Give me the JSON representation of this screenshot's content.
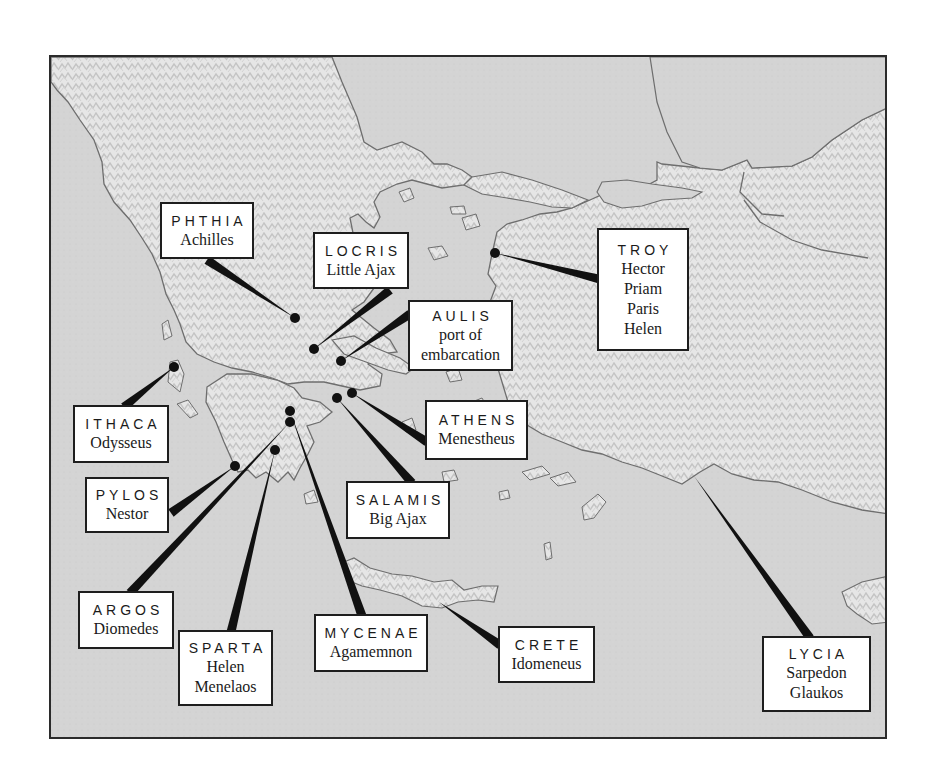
{
  "map": {
    "title": "Homeric Greece and Asia Minor",
    "colors": {
      "sea": "#d6d6d6",
      "land": "#e8e8e8",
      "relief": "#bdbdbd",
      "coast": "#6e6e6e",
      "marker": "#111111",
      "box_border": "#1e1e1e"
    }
  },
  "labels": [
    {
      "id": "phthia",
      "place": "PHTHIA",
      "people": [
        "Achilles"
      ],
      "box": [
        160,
        202,
        94,
        57
      ],
      "dot": [
        293,
        316
      ],
      "anchor": [
        205,
        258
      ]
    },
    {
      "id": "locris",
      "place": "LOCRIS",
      "people": [
        "Little Ajax"
      ],
      "box": [
        313,
        232,
        96,
        57
      ],
      "dot": [
        312,
        347
      ],
      "anchor": [
        388,
        288
      ]
    },
    {
      "id": "aulis",
      "place": "AULIS",
      "people": [
        "port of",
        "embarcation"
      ],
      "box": [
        408,
        300,
        105,
        71
      ],
      "dot": [
        339,
        359
      ],
      "anchor": [
        408,
        312
      ]
    },
    {
      "id": "troy",
      "place": "TROY",
      "people": [
        "Hector",
        "Priam",
        "Paris",
        "Helen"
      ],
      "box": [
        597,
        228,
        92,
        123
      ],
      "dot": [
        493,
        251
      ],
      "anchor": [
        597,
        277
      ]
    },
    {
      "id": "ithaca",
      "place": "ITHACA",
      "people": [
        "Odysseus"
      ],
      "box": [
        73,
        405,
        96,
        58
      ],
      "dot": [
        172,
        365
      ],
      "anchor": [
        122,
        405
      ]
    },
    {
      "id": "pylos",
      "place": "PYLOS",
      "people": [
        "Nestor"
      ],
      "box": [
        85,
        477,
        84,
        56
      ],
      "dot": [
        233,
        464
      ],
      "anchor": [
        169,
        511
      ]
    },
    {
      "id": "argos",
      "place": "ARGOS",
      "people": [
        "Diomedes"
      ],
      "box": [
        78,
        591,
        96,
        58
      ],
      "dot": [
        288,
        420
      ],
      "anchor": [
        128,
        591
      ]
    },
    {
      "id": "sparta",
      "place": "SPARTA",
      "people": [
        "Helen",
        "Menelaos"
      ],
      "box": [
        178,
        630,
        95,
        76
      ],
      "dot": [
        273,
        448
      ],
      "anchor": [
        229,
        630
      ]
    },
    {
      "id": "mycenae",
      "place": "MYCENAE",
      "people": [
        "Agamemnon"
      ],
      "box": [
        314,
        614,
        114,
        58
      ],
      "dot": [
        288,
        409
      ],
      "anchor": [
        360,
        614
      ]
    },
    {
      "id": "athens",
      "place": "ATHENS",
      "people": [
        "Menestheus"
      ],
      "box": [
        425,
        400,
        103,
        60
      ],
      "dot": [
        350,
        391
      ],
      "anchor": [
        425,
        440
      ]
    },
    {
      "id": "salamis",
      "place": "SALAMIS",
      "people": [
        "Big Ajax"
      ],
      "box": [
        346,
        481,
        104,
        58
      ],
      "dot": [
        335,
        396
      ],
      "anchor": [
        410,
        481
      ]
    },
    {
      "id": "crete",
      "place": "CRETE",
      "people": [
        "Idomeneus"
      ],
      "box": [
        498,
        626,
        97,
        57
      ],
      "dot": [
        437,
        600
      ],
      "anchor": [
        498,
        643
      ],
      "no_dot": true
    },
    {
      "id": "lycia",
      "place": "LYCIA",
      "people": [
        "Sarpedon",
        "Glaukos"
      ],
      "box": [
        762,
        636,
        109,
        76
      ],
      "dot": [
        692,
        474
      ],
      "anchor": [
        808,
        636
      ],
      "no_dot": true
    }
  ]
}
